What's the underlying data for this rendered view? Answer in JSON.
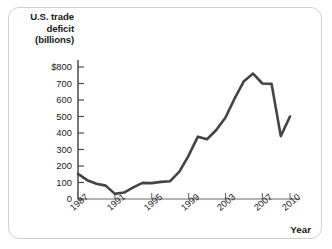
{
  "chart_data": {
    "type": "line",
    "title": "U.S. trade deficit (billions)",
    "title_lines": [
      "U.S. trade",
      "deficit",
      "(billions)"
    ],
    "xlabel": "Year",
    "ylabel": "U.S. trade deficit (billions)",
    "xlim": [
      1987,
      2010
    ],
    "ylim": [
      0,
      800
    ],
    "grid": false,
    "legend": null,
    "line_color": "#444444",
    "ytick_labels": [
      "$800",
      "700",
      "600",
      "500",
      "400",
      "300",
      "200",
      "100",
      "0"
    ],
    "ytick_values": [
      800,
      700,
      600,
      500,
      400,
      300,
      200,
      100,
      0
    ],
    "xtick_labels": [
      "1987",
      "1991",
      "1995",
      "1999",
      "2003",
      "2007",
      "2010"
    ],
    "xtick_values": [
      1987,
      1991,
      1995,
      1999,
      2003,
      2007,
      2010
    ],
    "x": [
      1987,
      1988,
      1989,
      1990,
      1991,
      1992,
      1993,
      1994,
      1995,
      1996,
      1997,
      1998,
      1999,
      2000,
      2001,
      2002,
      2003,
      2004,
      2005,
      2006,
      2007,
      2008,
      2009,
      2010
    ],
    "values": [
      152,
      114,
      93,
      81,
      31,
      39,
      70,
      98,
      96,
      104,
      108,
      166,
      263,
      378,
      362,
      418,
      494,
      610,
      714,
      760,
      700,
      698,
      381,
      500
    ],
    "series": [
      {
        "name": "U.S. trade deficit",
        "values": [
          152,
          114,
          93,
          81,
          31,
          39,
          70,
          98,
          96,
          104,
          108,
          166,
          263,
          378,
          362,
          418,
          494,
          610,
          714,
          760,
          700,
          698,
          381,
          500
        ]
      }
    ],
    "annotations": []
  }
}
